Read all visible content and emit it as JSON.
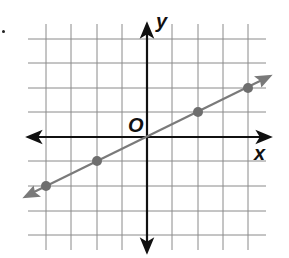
{
  "graph": {
    "axis_labels": {
      "x": "x",
      "y": "y",
      "origin": "O"
    },
    "grid": {
      "x_min": -4,
      "x_max": 4,
      "y_min": -4,
      "y_max": 4,
      "step": 1
    },
    "line": {
      "slope": 0.5,
      "intercept": 0,
      "color": "#7a7a7a"
    },
    "points": [
      {
        "x": -4,
        "y": -2
      },
      {
        "x": -2,
        "y": -1
      },
      {
        "x": 2,
        "y": 1
      },
      {
        "x": 4,
        "y": 2
      }
    ]
  }
}
